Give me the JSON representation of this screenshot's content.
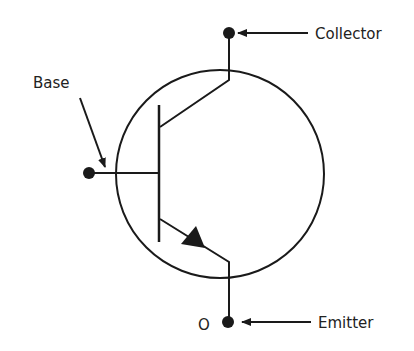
{
  "diagram": {
    "colors": {
      "stroke": "#1a1a1a",
      "text": "#222222",
      "background": "#ffffff"
    },
    "labels": {
      "collector": "Collector",
      "base": "Base",
      "emitter": "Emitter",
      "emitter_marker": "O"
    },
    "terminals": [
      "collector",
      "base",
      "emitter"
    ]
  }
}
